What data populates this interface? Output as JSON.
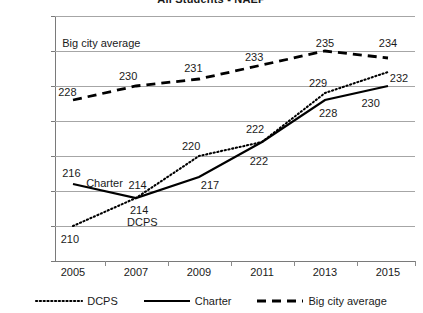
{
  "chart_data": {
    "type": "line",
    "title": "All Students - NAEP",
    "xlabel": "",
    "ylabel": "",
    "x": [
      "2005",
      "2007",
      "2009",
      "2011",
      "2013",
      "2015"
    ],
    "categories": [
      "2005",
      "2007",
      "2009",
      "2011",
      "2013",
      "2015"
    ],
    "ylim": [
      205,
      240
    ],
    "yticks": [
      205,
      210,
      215,
      220,
      225,
      230,
      235,
      240
    ],
    "grid": "horizontal",
    "legend_position": "bottom",
    "series": [
      {
        "name": "DCPS",
        "style": "dotted",
        "color": "#000000",
        "values": [
          210,
          214,
          220,
          222,
          229,
          232
        ],
        "labels": [
          "210",
          "214",
          "220",
          "222",
          "229",
          "232"
        ]
      },
      {
        "name": "Charter",
        "style": "solid",
        "color": "#000000",
        "values": [
          216,
          214,
          217,
          222,
          228,
          230
        ],
        "labels": [
          "216",
          "214",
          "217",
          "222",
          "228",
          "230"
        ]
      },
      {
        "name": "Big city average",
        "style": "dashed",
        "color": "#000000",
        "values": [
          228,
          230,
          231,
          233,
          235,
          234
        ],
        "labels": [
          "228",
          "230",
          "231",
          "233",
          "235",
          "234"
        ]
      }
    ],
    "annotations": [
      {
        "text": "Big city average",
        "x": 2005.9,
        "y": 236.2
      },
      {
        "text": "Charter",
        "x": 2006.0,
        "y": 216.2
      },
      {
        "text": "DCPS",
        "x": 2007.2,
        "y": 210.6
      }
    ],
    "point_labels": [
      {
        "series": "Big city average",
        "text": "228",
        "x": 2004.82,
        "y": 229.1
      },
      {
        "series": "Big city average",
        "text": "230",
        "x": 2006.75,
        "y": 231.4
      },
      {
        "series": "Big city average",
        "text": "231",
        "x": 2008.82,
        "y": 232.6
      },
      {
        "series": "Big city average",
        "text": "233",
        "x": 2010.75,
        "y": 234.2
      },
      {
        "series": "Big city average",
        "text": "235",
        "x": 2013.0,
        "y": 236.2
      },
      {
        "series": "Big city average",
        "text": "234",
        "x": 2015.0,
        "y": 236.2
      },
      {
        "series": "DCPS",
        "text": "210",
        "x": 2004.9,
        "y": 208.2
      },
      {
        "series": "DCPS",
        "text": "214",
        "x": 2007.1,
        "y": 212.3
      },
      {
        "series": "DCPS",
        "text": "220",
        "x": 2008.75,
        "y": 221.5
      },
      {
        "series": "DCPS",
        "text": "222",
        "x": 2010.78,
        "y": 223.8
      },
      {
        "series": "DCPS",
        "text": "229",
        "x": 2012.78,
        "y": 230.4
      },
      {
        "series": "DCPS",
        "text": "232",
        "x": 2015.35,
        "y": 231.2
      },
      {
        "series": "Charter",
        "text": "216",
        "x": 2004.95,
        "y": 217.6
      },
      {
        "series": "Charter",
        "text": "214",
        "x": 2007.05,
        "y": 215.9
      },
      {
        "series": "Charter",
        "text": "217",
        "x": 2009.35,
        "y": 215.8
      },
      {
        "series": "Charter",
        "text": "222",
        "x": 2010.9,
        "y": 219.3
      },
      {
        "series": "Charter",
        "text": "228",
        "x": 2013.1,
        "y": 226.2
      },
      {
        "series": "Charter",
        "text": "230",
        "x": 2014.45,
        "y": 227.6
      }
    ]
  },
  "legend": {
    "items": [
      {
        "label": "DCPS",
        "style": "dotted"
      },
      {
        "label": "Charter",
        "style": "solid"
      },
      {
        "label": "Big city average",
        "style": "dashed"
      }
    ]
  }
}
